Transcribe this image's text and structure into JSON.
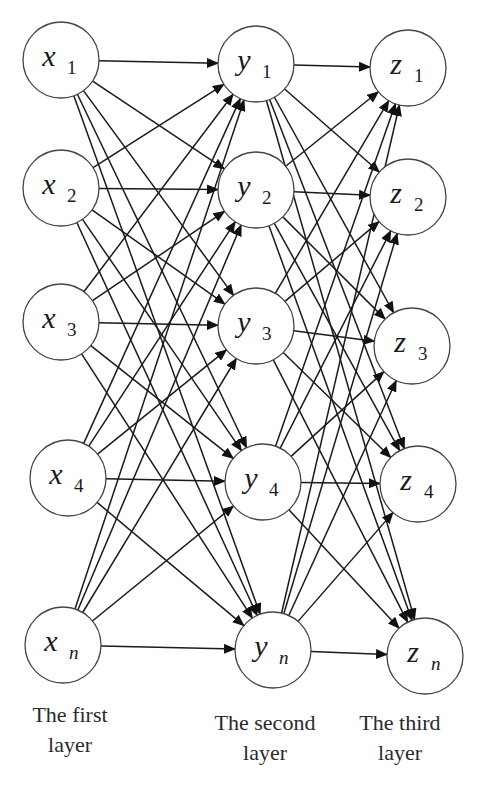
{
  "diagram": {
    "type": "three-layer fully-connected network",
    "layers": [
      {
        "label_line1": "The first",
        "label_line2": "layer",
        "nodes": [
          {
            "id": "x1",
            "var": "x",
            "sub": "1",
            "cx": 61,
            "cy": 60
          },
          {
            "id": "x2",
            "var": "x",
            "sub": "2",
            "cx": 61,
            "cy": 188
          },
          {
            "id": "x3",
            "var": "x",
            "sub": "3",
            "cx": 61,
            "cy": 322
          },
          {
            "id": "x4",
            "var": "x",
            "sub": "4",
            "cx": 68,
            "cy": 478
          },
          {
            "id": "xn",
            "var": "x",
            "sub": "n",
            "cx": 63,
            "cy": 645
          }
        ]
      },
      {
        "label_line1": "The second",
        "label_line2": "layer",
        "nodes": [
          {
            "id": "y1",
            "var": "y",
            "sub": "1",
            "cx": 256,
            "cy": 64
          },
          {
            "id": "y2",
            "var": "y",
            "sub": "2",
            "cx": 256,
            "cy": 190
          },
          {
            "id": "y3",
            "var": "y",
            "sub": "3",
            "cx": 256,
            "cy": 326
          },
          {
            "id": "y4",
            "var": "y",
            "sub": "4",
            "cx": 263,
            "cy": 482
          },
          {
            "id": "yn",
            "var": "y",
            "sub": "n",
            "cx": 273,
            "cy": 650
          }
        ]
      },
      {
        "label_line1": "The third",
        "label_line2": "layer",
        "nodes": [
          {
            "id": "z1",
            "var": "z",
            "sub": "1",
            "cx": 408,
            "cy": 68
          },
          {
            "id": "z2",
            "var": "z",
            "sub": "2",
            "cx": 408,
            "cy": 197
          },
          {
            "id": "z3",
            "var": "z",
            "sub": "3",
            "cx": 412,
            "cy": 346
          },
          {
            "id": "z4",
            "var": "z",
            "sub": "4",
            "cx": 418,
            "cy": 484
          },
          {
            "id": "zn",
            "var": "z",
            "sub": "n",
            "cx": 425,
            "cy": 656
          }
        ]
      }
    ],
    "node_radius": 38,
    "connections": "every node in layer k connects to every node in layer k+1 with a directed arrow",
    "colors": {
      "stroke": "#1a1a1a",
      "node_fill": "#ffffff",
      "node_stroke": "#444444"
    }
  }
}
